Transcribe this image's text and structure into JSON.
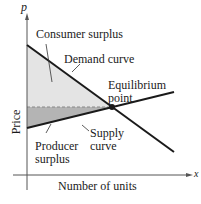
{
  "diagram": {
    "axes": {
      "x_symbol": "x",
      "y_symbol": "p",
      "x_label": "Number of units",
      "y_label": "Price"
    },
    "labels": {
      "consumer_surplus": "Consumer surplus",
      "demand_curve": "Demand curve",
      "equilibrium_1": "Equilibrium",
      "equilibrium_2": "point",
      "producer_1": "Producer",
      "producer_2": "surplus",
      "supply_1": "Supply",
      "supply_2": "curve"
    },
    "colors": {
      "consumer_fill": "#e4e4e4",
      "producer_fill": "#b4b4b4",
      "line": "#1a1a1a",
      "dashed": "#888888"
    }
  }
}
